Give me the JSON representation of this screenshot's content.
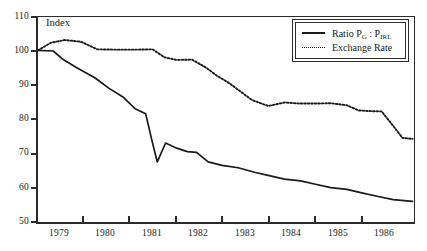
{
  "chart_data": {
    "type": "line",
    "title": "",
    "xlabel": "",
    "ylabel": "Index",
    "ylim": [
      50,
      110
    ],
    "xlim": [
      1978.6,
      1986.75
    ],
    "yticks": [
      50,
      60,
      70,
      80,
      90,
      100,
      110
    ],
    "xticks": [
      "1979",
      "1980",
      "1981",
      "1982",
      "1983",
      "1984",
      "1985",
      "1986"
    ],
    "grid": false,
    "legend_position": "top-right",
    "series": [
      {
        "name": "Ratio P_G : P_IRL",
        "style": "solid",
        "x": [
          1978.62,
          1978.95,
          1979.15,
          1979.45,
          1979.85,
          1980.15,
          1980.45,
          1980.72,
          1980.95,
          1981.08,
          1981.2,
          1981.38,
          1981.62,
          1981.85,
          1982.05,
          1982.3,
          1982.6,
          1982.95,
          1983.3,
          1983.62,
          1983.95,
          1984.3,
          1984.62,
          1984.95,
          1985.3,
          1985.62,
          1985.95,
          1986.3,
          1986.72
        ],
        "values": [
          100.0,
          99.8,
          97.5,
          95.0,
          92.0,
          89.0,
          86.5,
          83.0,
          81.5,
          74.0,
          67.5,
          73.0,
          71.5,
          70.5,
          70.3,
          67.5,
          66.5,
          65.8,
          64.5,
          63.5,
          62.5,
          62.0,
          61.0,
          60.0,
          59.5,
          58.5,
          57.5,
          56.5,
          56.0
        ]
      },
      {
        "name": "Exchange Rate",
        "style": "dotted",
        "x": [
          1978.62,
          1978.9,
          1979.2,
          1979.55,
          1979.9,
          1980.3,
          1980.75,
          1981.1,
          1981.35,
          1981.62,
          1981.95,
          1982.25,
          1982.5,
          1982.75,
          1983.0,
          1983.25,
          1983.6,
          1983.95,
          1984.3,
          1984.6,
          1984.95,
          1985.3,
          1985.55,
          1985.8,
          1986.05,
          1986.3,
          1986.5,
          1986.72
        ],
        "values": [
          100.0,
          102.2,
          103.0,
          102.5,
          100.3,
          100.2,
          100.2,
          100.3,
          98.0,
          97.2,
          97.3,
          95.0,
          92.5,
          90.5,
          88.0,
          85.5,
          83.8,
          84.8,
          84.5,
          84.5,
          84.6,
          84.0,
          82.5,
          82.3,
          82.2,
          78.0,
          74.5,
          74.2
        ]
      }
    ]
  },
  "axis": {
    "y_title": "Index",
    "y_ticks": [
      "110",
      "100",
      "90",
      "80",
      "70",
      "60",
      "50"
    ],
    "x_ticks": [
      "1979",
      "1980",
      "1981",
      "1982",
      "1983",
      "1984",
      "1985",
      "1986"
    ]
  },
  "legend": {
    "entries": [
      {
        "label_prefix": "Ratio P",
        "label_sub1": "G",
        "label_mid": " : P",
        "label_sub2": "IRL",
        "style": "solid"
      },
      {
        "label_prefix": "Exchange Rate",
        "label_sub1": "",
        "label_mid": "",
        "label_sub2": "",
        "style": "dotted"
      }
    ],
    "solid_label": "Ratio P",
    "solid_sub_g": "G",
    "solid_sep": " : P",
    "solid_sub_irl": "IRL",
    "dotted_label": "Exchange Rate"
  },
  "colors": {
    "line": "#1a1a1a",
    "axis": "#2b2b2b",
    "background": "#ffffff"
  }
}
